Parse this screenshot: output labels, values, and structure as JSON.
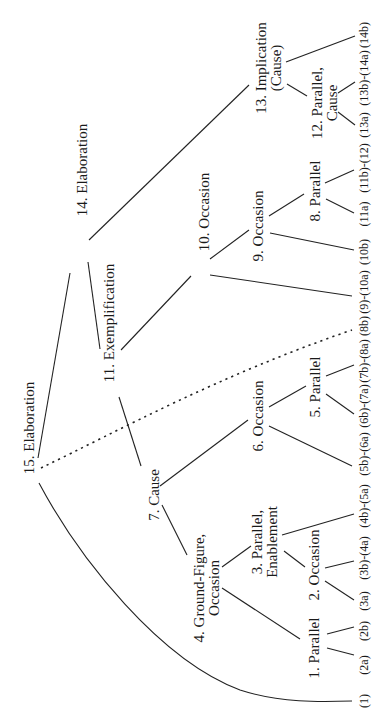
{
  "diagram": {
    "orientation": "rotated-90-ccw",
    "nodes": {
      "n15": {
        "lines": [
          "15. Elaboration"
        ]
      },
      "n14": {
        "lines": [
          "14. Elaboration"
        ]
      },
      "n11": {
        "lines": [
          "11. Exemplification"
        ]
      },
      "n7": {
        "lines": [
          "7. Cause"
        ]
      },
      "n4": {
        "lines": [
          "4. Ground-Figure,",
          "Occasion"
        ]
      },
      "n3": {
        "lines": [
          "3. Parallel,",
          "Enablement"
        ]
      },
      "n2": {
        "lines": [
          "2. Occasion"
        ]
      },
      "n1": {
        "lines": [
          "1. Parallel"
        ]
      },
      "n6": {
        "lines": [
          "6. Occasion"
        ]
      },
      "n5": {
        "lines": [
          "5. Parallel"
        ]
      },
      "n10": {
        "lines": [
          "10. Occasion"
        ]
      },
      "n9": {
        "lines": [
          "9. Occasion"
        ]
      },
      "n8": {
        "lines": [
          "8. Parallel"
        ]
      },
      "n13": {
        "lines": [
          "13. Implication",
          "(Cause)"
        ]
      },
      "n12": {
        "lines": [
          "12. Parallel,",
          "Cause"
        ]
      }
    },
    "leaves": [
      "(1)",
      "(2a)",
      "(2b)",
      "(3a)",
      "(3b)-(4a)",
      "(4b)-(5a)",
      "(5b)-(6a)",
      "(6b)-(7a)",
      "(7b)-(8a)",
      "(8b)",
      "(9)-(10a)",
      "(10b)",
      "(11a)",
      "(11b)-(12)",
      "(13a)",
      "(13b)-(14a)",
      "(14b)"
    ],
    "edges": [
      {
        "from": "15. Elaboration",
        "to": "14. Elaboration",
        "style": "solid"
      },
      {
        "from": "15. Elaboration",
        "to": "(1)",
        "style": "solid-curve"
      },
      {
        "from": "15. Elaboration",
        "to": "(8b)",
        "style": "dotted"
      },
      {
        "from": "14. Elaboration",
        "to": "11. Exemplification",
        "style": "solid"
      },
      {
        "from": "14. Elaboration",
        "to": "13. Implication (Cause)",
        "style": "solid"
      },
      {
        "from": "11. Exemplification",
        "to": "7. Cause",
        "style": "solid"
      },
      {
        "from": "11. Exemplification",
        "to": "10. Occasion",
        "style": "solid"
      },
      {
        "from": "7. Cause",
        "to": "4. Ground-Figure, Occasion",
        "style": "solid"
      },
      {
        "from": "7. Cause",
        "to": "6. Occasion",
        "style": "solid"
      },
      {
        "from": "4. Ground-Figure, Occasion",
        "to": "1. Parallel",
        "style": "solid"
      },
      {
        "from": "4. Ground-Figure, Occasion",
        "to": "3. Parallel, Enablement",
        "style": "solid"
      },
      {
        "from": "1. Parallel",
        "to": "(2a)",
        "style": "solid"
      },
      {
        "from": "1. Parallel",
        "to": "(2b)",
        "style": "solid"
      },
      {
        "from": "3. Parallel, Enablement",
        "to": "2. Occasion",
        "style": "solid"
      },
      {
        "from": "3. Parallel, Enablement",
        "to": "(4b)-(5a)",
        "style": "solid"
      },
      {
        "from": "2. Occasion",
        "to": "(3a)",
        "style": "solid"
      },
      {
        "from": "2. Occasion",
        "to": "(3b)-(4a)",
        "style": "solid"
      },
      {
        "from": "6. Occasion",
        "to": "(5b)-(6a)",
        "style": "solid"
      },
      {
        "from": "6. Occasion",
        "to": "5. Parallel",
        "style": "solid"
      },
      {
        "from": "5. Parallel",
        "to": "(6b)-(7a)",
        "style": "solid"
      },
      {
        "from": "5. Parallel",
        "to": "(7b)-(8a)",
        "style": "solid"
      },
      {
        "from": "10. Occasion",
        "to": "(9)-(10a)",
        "style": "solid"
      },
      {
        "from": "10. Occasion",
        "to": "9. Occasion",
        "style": "solid"
      },
      {
        "from": "9. Occasion",
        "to": "(10b)",
        "style": "solid"
      },
      {
        "from": "9. Occasion",
        "to": "8. Parallel",
        "style": "solid"
      },
      {
        "from": "8. Parallel",
        "to": "(11a)",
        "style": "solid"
      },
      {
        "from": "8. Parallel",
        "to": "(11b)-(12)",
        "style": "solid"
      },
      {
        "from": "13. Implication (Cause)",
        "to": "12. Parallel, Cause",
        "style": "solid"
      },
      {
        "from": "13. Implication (Cause)",
        "to": "(14b)",
        "style": "solid"
      },
      {
        "from": "12. Parallel, Cause",
        "to": "(13a)",
        "style": "solid"
      },
      {
        "from": "12. Parallel, Cause",
        "to": "(13b)-(14a)",
        "style": "solid"
      }
    ]
  }
}
